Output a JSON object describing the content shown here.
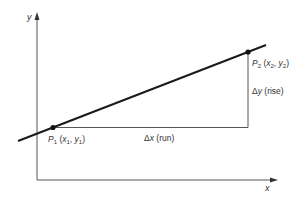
{
  "diagram": {
    "type": "slope-of-line",
    "axes": {
      "x_label": "x",
      "y_label": "y"
    },
    "points": [
      {
        "name": "P",
        "sub": "1",
        "coord_x": "x",
        "coord_x_sub": "1",
        "coord_y": "y",
        "coord_y_sub": "1"
      },
      {
        "name": "P",
        "sub": "2",
        "coord_x": "x",
        "coord_x_sub": "2",
        "coord_y": "y",
        "coord_y_sub": "2"
      }
    ],
    "run": {
      "delta": "Δ",
      "var": "x",
      "label": "(run)"
    },
    "rise": {
      "delta": "Δ",
      "var": "y",
      "label": "(rise)"
    },
    "colors": {
      "line": "#1a1a1a",
      "axes": "#555555",
      "text": "#333333",
      "background": "#ffffff"
    }
  }
}
